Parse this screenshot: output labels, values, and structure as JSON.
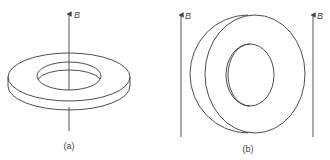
{
  "figure": {
    "panel_a": {
      "label": "(a)",
      "field_label": "B",
      "description": "Flat ring (washer) lying horizontally with magnetic field B along its axis"
    },
    "panel_b": {
      "label": "(b)",
      "field_label_left": "B",
      "field_label_right": "B",
      "description": "Ring standing vertically with magnetic field B parallel to its plane"
    },
    "colors": {
      "line": "#3a3a3a",
      "background": "#ffffff"
    }
  }
}
